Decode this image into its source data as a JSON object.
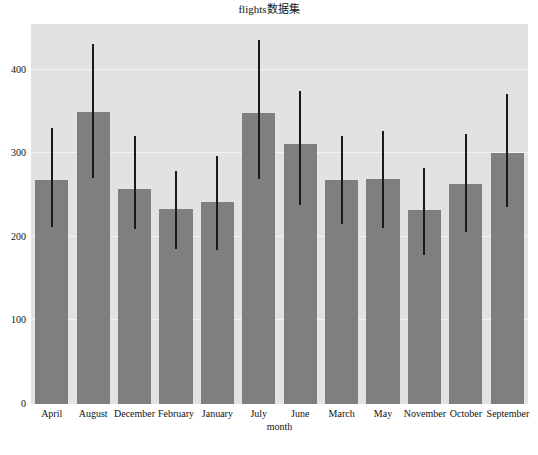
{
  "chart_data": {
    "type": "bar",
    "title": "flights数据集",
    "xlabel": "month",
    "ylabel": "",
    "grid": true,
    "legend": null,
    "ylim": [
      0,
      455
    ],
    "yticks": [
      0,
      100,
      200,
      300,
      400
    ],
    "ytick_labels": [
      "0",
      "100",
      "200",
      "300",
      "400"
    ],
    "categories": [
      "April",
      "August",
      "December",
      "February",
      "January",
      "July",
      "June",
      "March",
      "May",
      "November",
      "October",
      "September"
    ],
    "values": [
      268,
      350,
      258,
      233,
      242,
      348,
      311,
      268,
      270,
      232,
      264,
      300
    ],
    "error_low": [
      212,
      271,
      210,
      186,
      184,
      269,
      238,
      215,
      211,
      178,
      206,
      236
    ],
    "error_high": [
      330,
      431,
      321,
      279,
      297,
      436,
      375,
      321,
      327,
      283,
      323,
      371
    ],
    "series": [
      {
        "name": "passengers",
        "values": [
          268,
          350,
          258,
          233,
          242,
          348,
          311,
          268,
          270,
          232,
          264,
          300
        ]
      }
    ],
    "bar_color": "#7f7f7f",
    "error_color": "#1a1a1a",
    "plot_background": "#e2e2e2",
    "grid_color": "#f3f3f3",
    "figure_background": "#ffffff"
  }
}
